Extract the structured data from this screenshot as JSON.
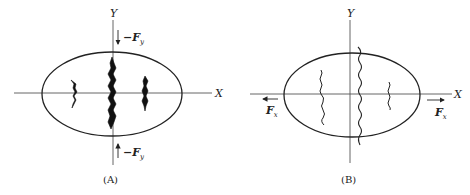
{
  "panels": [
    {
      "id": "A",
      "caption": "(A)",
      "axes": {
        "x_label": "X",
        "y_label": "Y"
      },
      "forces": {
        "top": {
          "sign": "−",
          "symbol": "F",
          "subscript": "y",
          "direction": "down"
        },
        "bottom": {
          "sign": "−",
          "symbol": "F",
          "subscript": "y",
          "direction": "up"
        }
      },
      "cracks": {
        "count": 3,
        "style": "thick-filled",
        "orientation": "vertical"
      }
    },
    {
      "id": "B",
      "caption": "(B)",
      "axes": {
        "x_label": "X",
        "y_label": "Y"
      },
      "forces": {
        "left": {
          "symbol": "F",
          "subscript": "x",
          "direction": "left"
        },
        "right": {
          "symbol": "F",
          "subscript": "x",
          "direction": "right"
        }
      },
      "cracks": {
        "count": 3,
        "style": "thin-wavy",
        "orientation": "vertical"
      }
    }
  ],
  "colors": {
    "stroke": "#222222",
    "axis": "#555555",
    "background": "#ffffff"
  }
}
